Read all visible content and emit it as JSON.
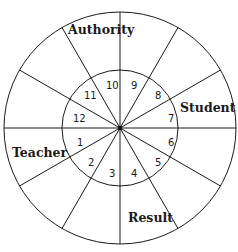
{
  "diagram": {
    "type": "concentric-wheel",
    "center": {
      "x": 120,
      "y": 128
    },
    "outer_radius": 116,
    "inner_radius": 58,
    "spoke_count": 12,
    "spoke_angles_deg": [
      0,
      30,
      60,
      90,
      120,
      150,
      180,
      210,
      240,
      270,
      300,
      330
    ],
    "colors": {
      "line": "#1a1a1a",
      "background": "#ffffff",
      "text": "#1a1a1a"
    },
    "outer_labels": [
      {
        "text": "Authority",
        "x": 68,
        "y": 34
      },
      {
        "text": "Student",
        "x": 180,
        "y": 112
      },
      {
        "text": "Teacher",
        "x": 12,
        "y": 157
      },
      {
        "text": "Result",
        "x": 128,
        "y": 222
      }
    ],
    "inner_numbers": [
      {
        "text": "1",
        "x": 77,
        "y": 146
      },
      {
        "text": "2",
        "x": 88,
        "y": 166
      },
      {
        "text": "3",
        "x": 109,
        "y": 177
      },
      {
        "text": "4",
        "x": 131,
        "y": 177
      },
      {
        "text": "5",
        "x": 155,
        "y": 166
      },
      {
        "text": "6",
        "x": 168,
        "y": 146
      },
      {
        "text": "7",
        "x": 168,
        "y": 122
      },
      {
        "text": "8",
        "x": 155,
        "y": 99
      },
      {
        "text": "9",
        "x": 131,
        "y": 89
      },
      {
        "text": "10",
        "x": 106,
        "y": 89
      },
      {
        "text": "11",
        "x": 84,
        "y": 99
      },
      {
        "text": "12",
        "x": 73,
        "y": 122
      }
    ]
  }
}
